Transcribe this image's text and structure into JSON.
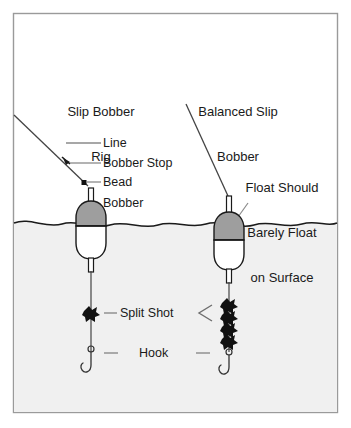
{
  "figure": {
    "kind": "fishing-rig-diagram",
    "width": 351,
    "height": 428,
    "frame": {
      "x": 13,
      "y": 13,
      "width": 325,
      "height": 400,
      "stroke": "#9a9a9a"
    },
    "colors": {
      "sky": "#ffffff",
      "water": "#f0f0f0",
      "waterline": "#1a1a1a",
      "line": "#555555",
      "ink": "#1a1a1a",
      "bobber_top": "#9e9e9e",
      "bobber_bottom": "#ffffff",
      "bobber_outline": "#1a1a1a",
      "split_shot": "#111111",
      "leader": "#6e6e6e"
    }
  },
  "titles": {
    "left": {
      "line1": "Slip Bobber",
      "line2": "Rig"
    },
    "right": {
      "line1": "Balanced Slip",
      "line2": "Bobber"
    }
  },
  "callouts": {
    "float_note": {
      "line1": "Float Should",
      "line2": "Barely Float",
      "line3": "on Surface"
    }
  },
  "labels": {
    "line": "Line",
    "bobber_stop": "Bobber Stop",
    "bead": "Bead",
    "bobber": "Bobber",
    "split_shot": "Split Shot",
    "hook": "Hook"
  },
  "rigs": [
    {
      "id": "slip-bobber-rig",
      "name": "Slip Bobber Rig",
      "side": "left",
      "bobber_x": 91,
      "float_level": "high",
      "split_shot_count": 1,
      "components": [
        "line",
        "bobber-stop",
        "bead",
        "bobber",
        "split-shot",
        "hook"
      ]
    },
    {
      "id": "balanced-slip-bobber",
      "name": "Balanced Slip Bobber",
      "side": "right",
      "bobber_x": 229,
      "float_level": "barely-floating",
      "split_shot_count": 4,
      "components": [
        "line",
        "bobber",
        "split-shot",
        "hook"
      ]
    }
  ],
  "waterline": {
    "y": 222,
    "style": "wavy"
  }
}
